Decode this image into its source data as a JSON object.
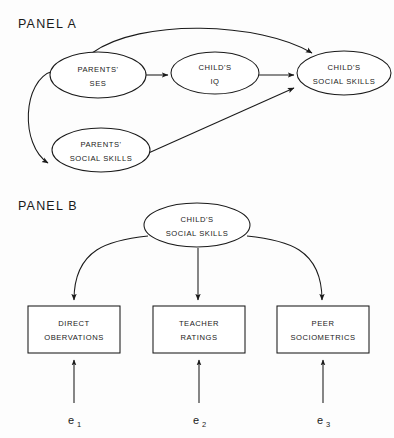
{
  "figure": {
    "background_color": "#fdfdfd",
    "stroke_color": "#1a1a1a",
    "fill_color": "#ffffff"
  },
  "panel_a": {
    "label": "PANEL A",
    "nodes": {
      "parents_ses": {
        "line1": "PARENTS'",
        "line2": "SES"
      },
      "childs_iq": {
        "line1": "CHILD'S",
        "line2": "IQ"
      },
      "childs_social_skills": {
        "line1": "CHILD'S",
        "line2": "SOCIAL SKILLS"
      },
      "parents_social_skills": {
        "line1": "PARENTS'",
        "line2": "SOCIAL SKILLS"
      }
    }
  },
  "panel_b": {
    "label": "PANEL B",
    "latent": {
      "line1": "CHILD'S",
      "line2": "SOCIAL SKILLS"
    },
    "indicators": [
      {
        "line1": "DIRECT",
        "line2": "OBERVATIONS"
      },
      {
        "line1": "TEACHER",
        "line2": "RATINGS"
      },
      {
        "line1": "PEER",
        "line2": "SOCIOMETRICS"
      }
    ],
    "errors": [
      {
        "symbol": "e",
        "subscript": "1"
      },
      {
        "symbol": "e",
        "subscript": "2"
      },
      {
        "symbol": "e",
        "subscript": "3"
      }
    ]
  }
}
